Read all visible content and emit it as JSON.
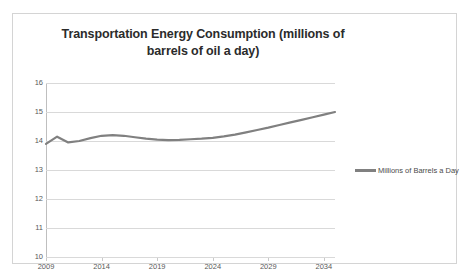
{
  "chart_data": {
    "type": "line",
    "title": "Transportation Energy Consumption (millions of barrels of oil a day)",
    "title_line1": "Transportation Energy Consumption (millions of",
    "title_line2": "barrels of oil a day)",
    "xlabel": "",
    "ylabel": "",
    "ylim": [
      10,
      16
    ],
    "xlim": [
      2009,
      2035
    ],
    "yticks": [
      "16",
      "15",
      "14",
      "13",
      "12",
      "11",
      "10"
    ],
    "ytick_values": [
      16,
      15,
      14,
      13,
      12,
      11,
      10
    ],
    "xticks": [
      "2009",
      "2014",
      "2019",
      "2024",
      "2029",
      "2034"
    ],
    "xtick_values": [
      2009,
      2014,
      2019,
      2024,
      2029,
      2034
    ],
    "grid": true,
    "grid_axis": "y",
    "legend_position": "right",
    "legend": [
      "Millions of Barrels a Day"
    ],
    "series": [
      {
        "name": "Millions of Barrels a Day",
        "color": "#808080",
        "x": [
          2009,
          2010,
          2011,
          2012,
          2013,
          2014,
          2015,
          2016,
          2017,
          2018,
          2019,
          2020,
          2021,
          2022,
          2023,
          2024,
          2025,
          2026,
          2027,
          2028,
          2029,
          2030,
          2031,
          2032,
          2033,
          2034,
          2035
        ],
        "values": [
          13.9,
          14.15,
          13.95,
          14.0,
          14.1,
          14.18,
          14.2,
          14.18,
          14.13,
          14.08,
          14.05,
          14.03,
          14.04,
          14.06,
          14.08,
          14.11,
          14.16,
          14.22,
          14.3,
          14.38,
          14.46,
          14.55,
          14.64,
          14.73,
          14.82,
          14.91,
          15.0
        ]
      }
    ]
  },
  "legend_entry": {
    "label": "Millions of Barrels a Day",
    "color": "#808080"
  }
}
